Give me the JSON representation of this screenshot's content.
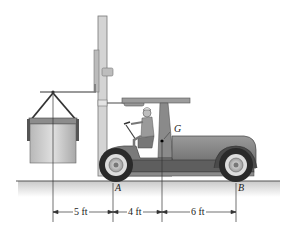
{
  "figure": {
    "points": {
      "A": "A",
      "B": "B",
      "G": "G"
    },
    "dimensions": [
      {
        "label": "5 ft",
        "from": "load line",
        "to": "A"
      },
      {
        "label": "4 ft",
        "from": "A",
        "to": "G line"
      },
      {
        "label": "6 ft",
        "from": "G line",
        "to": "B"
      }
    ],
    "colors": {
      "body": "#8a8a8a",
      "body_dark": "#5a5a5a",
      "mast": "#c8c8c8",
      "ground": "#d8d8d8",
      "tire": "#2a2a2a",
      "load": "#c4c4c4",
      "line": "#333333"
    }
  }
}
